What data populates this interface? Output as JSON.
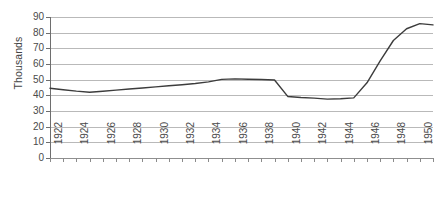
{
  "chart_data": {
    "type": "line",
    "title": "",
    "subtitle": "",
    "xlabel": "",
    "ylabel": "Thousands",
    "ylim": [
      0,
      90
    ],
    "ytick_step": 10,
    "yticks": [
      90,
      80,
      70,
      60,
      50,
      40,
      30,
      20,
      10,
      0
    ],
    "xlim": [
      1922,
      1951
    ],
    "xtick_step": 1,
    "xlabel_step": 2,
    "xtick_labels": [
      "1922",
      "1924",
      "1926",
      "1928",
      "1930",
      "1932",
      "1934",
      "1936",
      "1938",
      "1940",
      "1942",
      "1944",
      "1946",
      "1948",
      "1950"
    ],
    "grid": true,
    "grid_axis": "y",
    "legend": false,
    "legend_position": "none",
    "line_color": "#3c3c3c",
    "grid_color": "#b9b9b9",
    "axis_color": "#8f8f8f",
    "background": "#ffffff",
    "x": [
      1922,
      1923,
      1924,
      1925,
      1926,
      1927,
      1928,
      1929,
      1930,
      1931,
      1932,
      1933,
      1934,
      1935,
      1936,
      1937,
      1938,
      1939,
      1940,
      1941,
      1942,
      1943,
      1944,
      1945,
      1946,
      1947,
      1948,
      1949,
      1950,
      1951
    ],
    "series": [
      {
        "name": "value",
        "values": [
          44.5,
          43.6,
          42.7,
          42.0,
          42.6,
          43.3,
          44.0,
          44.7,
          45.4,
          46.1,
          46.8,
          47.6,
          48.6,
          50.2,
          50.5,
          50.3,
          50.1,
          49.8,
          39.3,
          38.6,
          38.2,
          37.6,
          37.8,
          38.4,
          48.0,
          62.0,
          75.0,
          82.5,
          85.8,
          85.0
        ]
      }
    ]
  }
}
